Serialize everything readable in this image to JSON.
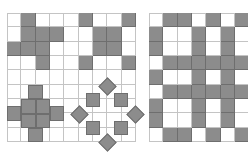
{
  "colors": {
    "fill": "#8c8c8c",
    "edge": "#6e6e6e",
    "line": "#c4c4c4",
    "background": "#ffffff"
  },
  "cell_size": 14.33,
  "left_grid": {
    "origin": [
      7,
      13
    ],
    "cols": 9,
    "rows": 9,
    "filled": [
      [
        0,
        1
      ],
      [
        0,
        5
      ],
      [
        0,
        8
      ],
      [
        1,
        1
      ],
      [
        1,
        2
      ],
      [
        1,
        3
      ],
      [
        1,
        6
      ],
      [
        1,
        7
      ],
      [
        2,
        0
      ],
      [
        2,
        1
      ],
      [
        2,
        2
      ],
      [
        2,
        6
      ],
      [
        2,
        7
      ],
      [
        3,
        2
      ],
      [
        3,
        5
      ],
      [
        3,
        8
      ]
    ],
    "cross_blocks": [
      {
        "name": "cross-top-arm",
        "x": 28,
        "y": 85,
        "w": 15,
        "h": 14
      },
      {
        "name": "cross-center-tl",
        "x": 21,
        "y": 99,
        "w": 15,
        "h": 15
      },
      {
        "name": "cross-center-tr",
        "x": 36,
        "y": 99,
        "w": 14,
        "h": 15
      },
      {
        "name": "cross-center-bl",
        "x": 21,
        "y": 114,
        "w": 15,
        "h": 14
      },
      {
        "name": "cross-center-br",
        "x": 36,
        "y": 114,
        "w": 14,
        "h": 14
      },
      {
        "name": "cross-left-arm",
        "x": 7,
        "y": 106,
        "w": 14,
        "h": 15
      },
      {
        "name": "cross-right-arm",
        "x": 50,
        "y": 106,
        "w": 14,
        "h": 15
      },
      {
        "name": "cross-bottom-arm",
        "x": 28,
        "y": 128,
        "w": 15,
        "h": 14
      }
    ],
    "ring_squares": [
      {
        "name": "ring-square-top-left",
        "cx": 93,
        "cy": 100,
        "size": 14
      },
      {
        "name": "ring-square-top-right",
        "cx": 121,
        "cy": 100,
        "size": 14
      },
      {
        "name": "ring-square-bottom-left",
        "cx": 93,
        "cy": 128,
        "size": 14
      },
      {
        "name": "ring-square-bottom-right",
        "cx": 121,
        "cy": 128,
        "size": 14
      }
    ],
    "ring_diamonds": [
      {
        "name": "ring-diamond-top",
        "cx": 107,
        "cy": 86,
        "size": 13
      },
      {
        "name": "ring-diamond-bottom",
        "cx": 107,
        "cy": 142,
        "size": 13
      },
      {
        "name": "ring-diamond-left",
        "cx": 79,
        "cy": 114,
        "size": 13
      },
      {
        "name": "ring-diamond-right",
        "cx": 135,
        "cy": 114,
        "size": 13
      }
    ]
  },
  "right_grid": {
    "origin": [
      149,
      13
    ],
    "cols": 7,
    "rows": 9,
    "filled": [
      [
        0,
        1
      ],
      [
        0,
        2
      ],
      [
        0,
        4
      ],
      [
        0,
        6
      ],
      [
        1,
        0
      ],
      [
        1,
        3
      ],
      [
        1,
        5
      ],
      [
        2,
        0
      ],
      [
        2,
        3
      ],
      [
        2,
        5
      ],
      [
        3,
        1
      ],
      [
        3,
        2
      ],
      [
        3,
        3
      ],
      [
        3,
        4
      ],
      [
        3,
        5
      ],
      [
        3,
        6
      ],
      [
        4,
        0
      ],
      [
        4,
        3
      ],
      [
        4,
        5
      ],
      [
        5,
        1
      ],
      [
        5,
        2
      ],
      [
        5,
        3
      ],
      [
        5,
        4
      ],
      [
        5,
        5
      ],
      [
        5,
        6
      ],
      [
        6,
        0
      ],
      [
        6,
        3
      ],
      [
        6,
        5
      ],
      [
        7,
        0
      ],
      [
        7,
        3
      ],
      [
        7,
        5
      ],
      [
        8,
        1
      ],
      [
        8,
        2
      ],
      [
        8,
        4
      ],
      [
        8,
        6
      ]
    ]
  }
}
